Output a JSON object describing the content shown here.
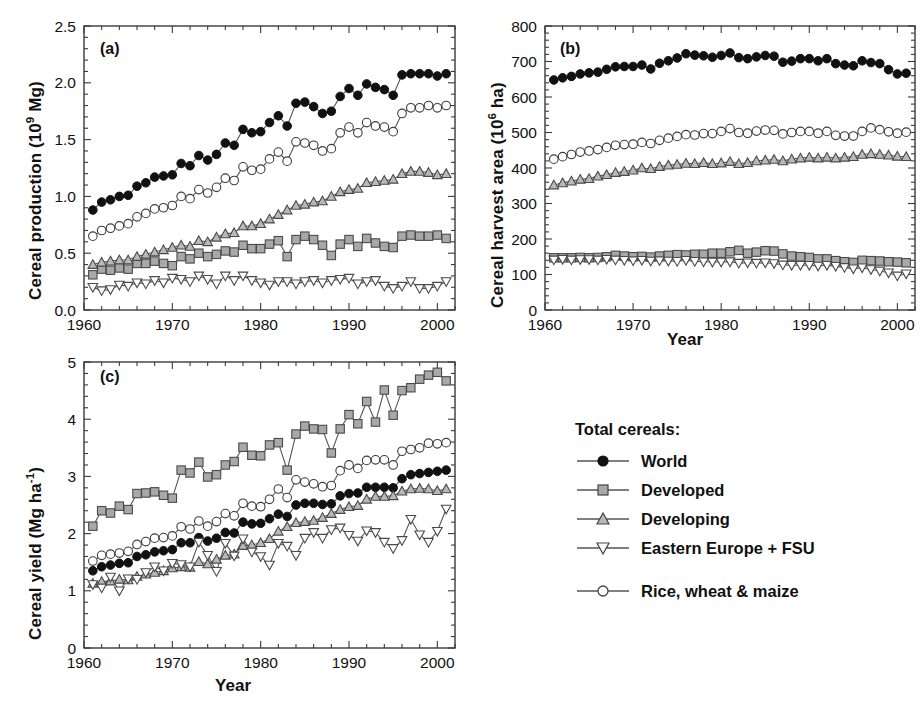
{
  "figure": {
    "xlabel": "Year",
    "panel_tags": [
      "(a)",
      "(b)",
      "(c)"
    ]
  },
  "legend": {
    "title": "Total cereals:",
    "entries": [
      {
        "label": "World",
        "marker": "filled-circle-icon"
      },
      {
        "label": "Developed",
        "marker": "gray-square-icon"
      },
      {
        "label": "Developing",
        "marker": "gray-triangle-up-icon"
      },
      {
        "label": "Eastern Europe + FSU",
        "marker": "open-triangle-down-icon"
      }
    ],
    "extra": [
      {
        "label": "Rice, wheat & maize",
        "marker": "open-circle-icon"
      }
    ]
  },
  "colors": {
    "axis": "#3a3a3a",
    "world": "#111111",
    "developed_fill": "#a8a8a8",
    "developing_fill": "#b5b5b5",
    "open": "#ffffff",
    "line": "#555555"
  },
  "chart_data": [
    {
      "type": "line",
      "panel": "(a)",
      "title": "",
      "xlabel": "Year",
      "ylabel": "Cereal production (10^9 Mg)",
      "ylabel_html": "Cereal production (10<sup>9</sup> Mg)",
      "xlim": [
        1960,
        2002
      ],
      "ylim": [
        0.0,
        2.5
      ],
      "xticks": [
        1960,
        1970,
        1980,
        1990,
        2000
      ],
      "yticks": [
        "0.0",
        "0.5",
        "1.0",
        "1.5",
        "2.0",
        "2.5"
      ],
      "ytick_values": [
        0.0,
        0.5,
        1.0,
        1.5,
        2.0,
        2.5
      ],
      "minor_x_step": 2,
      "minor_y_step": 0.1,
      "grid": false,
      "x": [
        1961,
        1962,
        1963,
        1964,
        1965,
        1966,
        1967,
        1968,
        1969,
        1970,
        1971,
        1972,
        1973,
        1974,
        1975,
        1976,
        1977,
        1978,
        1979,
        1980,
        1981,
        1982,
        1983,
        1984,
        1985,
        1986,
        1987,
        1988,
        1989,
        1990,
        1991,
        1992,
        1993,
        1994,
        1995,
        1996,
        1997,
        1998,
        1999,
        2000,
        2001
      ],
      "series": [
        {
          "name": "World",
          "marker": "filled-circle",
          "values": [
            0.88,
            0.95,
            0.97,
            1.0,
            1.01,
            1.09,
            1.12,
            1.17,
            1.18,
            1.19,
            1.29,
            1.27,
            1.36,
            1.32,
            1.37,
            1.47,
            1.45,
            1.59,
            1.56,
            1.57,
            1.65,
            1.71,
            1.62,
            1.82,
            1.83,
            1.79,
            1.73,
            1.75,
            1.88,
            1.95,
            1.89,
            1.99,
            1.96,
            1.94,
            1.89,
            2.07,
            2.08,
            2.08,
            2.08,
            2.06,
            2.08
          ]
        },
        {
          "name": "Developed",
          "marker": "gray-square",
          "values": [
            0.31,
            0.36,
            0.35,
            0.37,
            0.36,
            0.41,
            0.41,
            0.43,
            0.41,
            0.39,
            0.47,
            0.45,
            0.5,
            0.47,
            0.49,
            0.52,
            0.51,
            0.57,
            0.54,
            0.54,
            0.58,
            0.61,
            0.47,
            0.62,
            0.65,
            0.62,
            0.57,
            0.48,
            0.58,
            0.62,
            0.56,
            0.63,
            0.59,
            0.56,
            0.55,
            0.65,
            0.66,
            0.65,
            0.65,
            0.66,
            0.63
          ]
        },
        {
          "name": "Developing",
          "marker": "gray-triangle-up",
          "values": [
            0.4,
            0.42,
            0.43,
            0.44,
            0.44,
            0.47,
            0.49,
            0.51,
            0.53,
            0.55,
            0.57,
            0.56,
            0.61,
            0.6,
            0.64,
            0.67,
            0.68,
            0.74,
            0.74,
            0.76,
            0.8,
            0.84,
            0.88,
            0.92,
            0.93,
            0.95,
            0.96,
            1.0,
            1.04,
            1.06,
            1.07,
            1.12,
            1.13,
            1.14,
            1.15,
            1.2,
            1.22,
            1.22,
            1.21,
            1.19,
            1.2
          ]
        },
        {
          "name": "Eastern Europe + FSU",
          "marker": "open-triangle-down",
          "values": [
            0.2,
            0.17,
            0.18,
            0.22,
            0.21,
            0.24,
            0.23,
            0.26,
            0.24,
            0.28,
            0.27,
            0.25,
            0.3,
            0.27,
            0.23,
            0.3,
            0.26,
            0.3,
            0.26,
            0.24,
            0.22,
            0.25,
            0.25,
            0.23,
            0.25,
            0.26,
            0.24,
            0.26,
            0.27,
            0.28,
            0.23,
            0.25,
            0.26,
            0.21,
            0.19,
            0.21,
            0.25,
            0.19,
            0.19,
            0.21,
            0.25
          ]
        },
        {
          "name": "Rice, wheat & maize",
          "marker": "open-circle",
          "values": [
            0.65,
            0.7,
            0.72,
            0.74,
            0.76,
            0.82,
            0.85,
            0.89,
            0.9,
            0.92,
            1.0,
            0.98,
            1.06,
            1.03,
            1.08,
            1.16,
            1.14,
            1.26,
            1.23,
            1.24,
            1.33,
            1.39,
            1.31,
            1.48,
            1.47,
            1.45,
            1.4,
            1.42,
            1.56,
            1.61,
            1.56,
            1.65,
            1.62,
            1.61,
            1.57,
            1.73,
            1.78,
            1.78,
            1.8,
            1.78,
            1.8
          ]
        }
      ]
    },
    {
      "type": "line",
      "panel": "(b)",
      "title": "",
      "xlabel": "Year",
      "ylabel": "Cereal harvest area (10^6 ha)",
      "ylabel_html": "Cereal harvest area (10<sup>6</sup> ha)",
      "xlim": [
        1960,
        2002
      ],
      "ylim": [
        0,
        800
      ],
      "xticks": [
        1960,
        1970,
        1980,
        1990,
        2000
      ],
      "yticks": [
        "0",
        "100",
        "200",
        "300",
        "400",
        "500",
        "600",
        "700",
        "800"
      ],
      "ytick_values": [
        0,
        100,
        200,
        300,
        400,
        500,
        600,
        700,
        800
      ],
      "minor_x_step": 2,
      "minor_y_step": 20,
      "grid": false,
      "x": [
        1961,
        1962,
        1963,
        1964,
        1965,
        1966,
        1967,
        1968,
        1969,
        1970,
        1971,
        1972,
        1973,
        1974,
        1975,
        1976,
        1977,
        1978,
        1979,
        1980,
        1981,
        1982,
        1983,
        1984,
        1985,
        1986,
        1987,
        1988,
        1989,
        1990,
        1991,
        1992,
        1993,
        1994,
        1995,
        1996,
        1997,
        1998,
        1999,
        2000,
        2001
      ],
      "series": [
        {
          "name": "World",
          "marker": "filled-circle",
          "values": [
            648,
            654,
            658,
            665,
            668,
            670,
            678,
            685,
            686,
            686,
            690,
            679,
            695,
            702,
            710,
            722,
            718,
            716,
            712,
            717,
            724,
            711,
            708,
            713,
            717,
            715,
            698,
            701,
            708,
            708,
            702,
            708,
            694,
            690,
            688,
            702,
            697,
            694,
            677,
            665,
            667
          ]
        },
        {
          "name": "Developed",
          "marker": "gray-square",
          "values": [
            147,
            147,
            147,
            148,
            147,
            148,
            150,
            154,
            152,
            150,
            151,
            149,
            152,
            154,
            156,
            155,
            157,
            157,
            160,
            160,
            164,
            168,
            160,
            163,
            167,
            166,
            158,
            152,
            150,
            148,
            144,
            144,
            139,
            136,
            134,
            140,
            139,
            138,
            136,
            135,
            133
          ]
        },
        {
          "name": "Developing",
          "marker": "gray-triangle-up",
          "values": [
            352,
            358,
            363,
            368,
            370,
            377,
            381,
            387,
            390,
            394,
            400,
            398,
            404,
            408,
            410,
            413,
            412,
            415,
            412,
            414,
            418,
            412,
            415,
            420,
            422,
            424,
            420,
            425,
            428,
            430,
            428,
            430,
            428,
            430,
            432,
            438,
            440,
            438,
            436,
            433,
            432
          ]
        },
        {
          "name": "Eastern Europe + FSU",
          "marker": "open-triangle-down",
          "values": [
            141,
            143,
            141,
            142,
            142,
            141,
            143,
            141,
            140,
            139,
            140,
            138,
            139,
            138,
            137,
            140,
            137,
            136,
            135,
            135,
            136,
            132,
            133,
            132,
            133,
            131,
            127,
            126,
            126,
            126,
            124,
            126,
            123,
            120,
            116,
            119,
            114,
            110,
            105,
            96,
            102
          ]
        },
        {
          "name": "Rice, wheat & maize",
          "marker": "open-circle",
          "values": [
            425,
            432,
            438,
            445,
            448,
            452,
            458,
            464,
            466,
            467,
            472,
            469,
            478,
            484,
            489,
            494,
            493,
            497,
            497,
            503,
            511,
            500,
            498,
            504,
            507,
            506,
            496,
            500,
            503,
            503,
            498,
            503,
            492,
            490,
            490,
            503,
            513,
            508,
            502,
            498,
            501
          ]
        }
      ]
    },
    {
      "type": "line",
      "panel": "(c)",
      "title": "",
      "xlabel": "Year",
      "ylabel": "Cereal yield (Mg ha^-1)",
      "ylabel_html": "Cereal yield (Mg ha<sup>-1</sup>)",
      "xlim": [
        1960,
        2002
      ],
      "ylim": [
        0,
        5
      ],
      "xticks": [
        1960,
        1970,
        1980,
        1990,
        2000
      ],
      "yticks": [
        "0",
        "1",
        "2",
        "3",
        "4",
        "5"
      ],
      "ytick_values": [
        0,
        1,
        2,
        3,
        4,
        5
      ],
      "minor_x_step": 2,
      "minor_y_step": 0.2,
      "grid": false,
      "x": [
        1961,
        1962,
        1963,
        1964,
        1965,
        1966,
        1967,
        1968,
        1969,
        1970,
        1971,
        1972,
        1973,
        1974,
        1975,
        1976,
        1977,
        1978,
        1979,
        1980,
        1981,
        1982,
        1983,
        1984,
        1985,
        1986,
        1987,
        1988,
        1989,
        1990,
        1991,
        1992,
        1993,
        1994,
        1995,
        1996,
        1997,
        1998,
        1999,
        2000,
        2001
      ],
      "series": [
        {
          "name": "World",
          "marker": "filled-circle",
          "values": [
            1.35,
            1.42,
            1.45,
            1.48,
            1.49,
            1.6,
            1.63,
            1.68,
            1.7,
            1.72,
            1.84,
            1.84,
            1.93,
            1.87,
            1.92,
            2.02,
            2.01,
            2.2,
            2.17,
            2.18,
            2.26,
            2.34,
            2.3,
            2.5,
            2.53,
            2.53,
            2.51,
            2.52,
            2.66,
            2.7,
            2.71,
            2.81,
            2.81,
            2.81,
            2.8,
            2.96,
            3.03,
            3.05,
            3.07,
            3.09,
            3.11
          ]
        },
        {
          "name": "Developed",
          "marker": "gray-square",
          "values": [
            2.13,
            2.4,
            2.36,
            2.48,
            2.42,
            2.7,
            2.71,
            2.73,
            2.67,
            2.62,
            3.11,
            3.06,
            3.25,
            2.99,
            3.03,
            3.2,
            3.26,
            3.51,
            3.37,
            3.36,
            3.55,
            3.59,
            3.11,
            3.74,
            3.88,
            3.83,
            3.82,
            3.41,
            3.83,
            4.08,
            3.92,
            4.31,
            3.95,
            4.51,
            4.07,
            4.5,
            4.55,
            4.7,
            4.77,
            4.82,
            4.67
          ]
        },
        {
          "name": "Developing",
          "marker": "gray-triangle-up",
          "values": [
            1.13,
            1.16,
            1.17,
            1.2,
            1.19,
            1.25,
            1.29,
            1.32,
            1.35,
            1.4,
            1.42,
            1.41,
            1.51,
            1.47,
            1.55,
            1.62,
            1.64,
            1.79,
            1.8,
            1.84,
            1.91,
            2.04,
            2.12,
            2.19,
            2.21,
            2.23,
            2.28,
            2.35,
            2.42,
            2.47,
            2.49,
            2.6,
            2.65,
            2.65,
            2.66,
            2.74,
            2.78,
            2.79,
            2.78,
            2.75,
            2.78
          ]
        },
        {
          "name": "Eastern Europe + FSU",
          "marker": "open-triangle-down",
          "values": [
            1.11,
            1.05,
            1.24,
            1.0,
            1.21,
            1.2,
            1.32,
            1.42,
            1.35,
            1.48,
            1.46,
            1.42,
            1.85,
            1.62,
            1.34,
            1.83,
            1.61,
            1.91,
            1.68,
            1.6,
            1.45,
            1.83,
            1.78,
            1.62,
            1.92,
            2.02,
            1.92,
            2.07,
            2.1,
            1.97,
            1.87,
            2.05,
            2.02,
            1.85,
            1.74,
            1.88,
            2.25,
            1.98,
            1.85,
            2.04,
            2.43
          ]
        },
        {
          "name": "Rice, wheat & maize",
          "marker": "open-circle",
          "values": [
            1.52,
            1.62,
            1.64,
            1.66,
            1.69,
            1.81,
            1.86,
            1.92,
            1.93,
            1.96,
            2.12,
            2.08,
            2.22,
            2.13,
            2.21,
            2.35,
            2.31,
            2.53,
            2.48,
            2.47,
            2.6,
            2.78,
            2.63,
            2.94,
            2.9,
            2.87,
            2.82,
            2.84,
            3.1,
            3.2,
            3.14,
            3.28,
            3.29,
            3.29,
            3.2,
            3.44,
            3.47,
            3.5,
            3.58,
            3.57,
            3.59
          ]
        }
      ]
    }
  ]
}
